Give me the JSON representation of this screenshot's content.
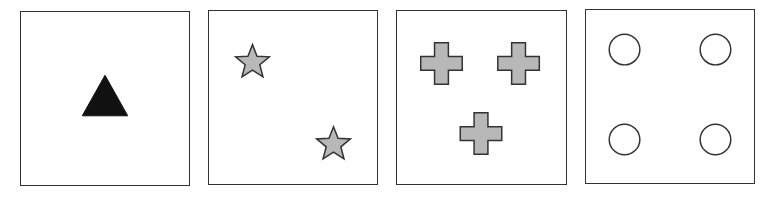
{
  "figure": {
    "colors": {
      "border": "#333333",
      "triangle_fill": "#111111",
      "shape_fill": "#b8b8b8",
      "shape_stroke": "#333333",
      "circle_fill": "#ffffff"
    },
    "panels": [
      {
        "index": 1,
        "shape": "triangle",
        "count": 1,
        "fill": "black"
      },
      {
        "index": 2,
        "shape": "star",
        "count": 2,
        "fill": "gray"
      },
      {
        "index": 3,
        "shape": "cross",
        "count": 3,
        "fill": "gray"
      },
      {
        "index": 4,
        "shape": "circle",
        "count": 4,
        "fill": "white"
      }
    ]
  }
}
